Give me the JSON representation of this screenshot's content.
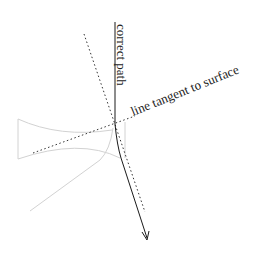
{
  "diagram": {
    "labels": {
      "correct_path": "correct path",
      "tangent_line": "line tangent to surface"
    },
    "colors": {
      "path": "#1a1a1a",
      "dotted": "#333333",
      "surface": "#cfcfcf",
      "text": "#222222",
      "background": "#ffffff"
    }
  }
}
